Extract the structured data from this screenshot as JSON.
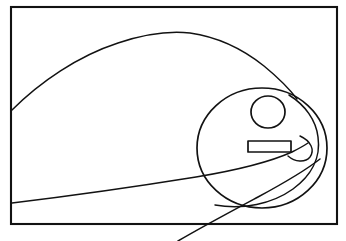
{
  "document": {
    "title": "Line Drawing",
    "width": 346,
    "height": 241,
    "background_color": "#ffffff",
    "ink_color": "#121212",
    "description": "Black-and-white hand-drawn line sketch inside a rectangular frame"
  },
  "frame": {
    "name": "border-rectangle",
    "x": 11,
    "y": 7,
    "width": 326,
    "height": 217,
    "stroke_width": 2.1,
    "color": "#121212"
  },
  "shapes": {
    "top_sweep": {
      "name": "top-sweeping-curve",
      "label": "Large arc from left border rising to apex then descending right",
      "start": [
        12,
        110
      ],
      "apex": [
        187,
        32
      ],
      "end": [
        297,
        99
      ],
      "path": "M 12,110 C 40,82 78,56 118,43 C 148,33 172,31 190,33 C 218,37 244,50 264,66 C 281,80 291,91 297,99"
    },
    "head_circle": {
      "name": "large-head-circle",
      "label": "Big circle forming the head",
      "cx": 262,
      "cy": 148,
      "rx": 65,
      "ry": 60,
      "left_edge_x": 197,
      "right_edge_x": 327,
      "top_y": 88,
      "bottom_y": 208
    },
    "eye_circle": {
      "name": "eye-circle",
      "label": "Small circle forming the eye",
      "cx": 268,
      "cy": 112,
      "rx": 17,
      "ry": 16,
      "left_edge_x": 251,
      "right_edge_x": 285,
      "top_y": 96,
      "bottom_y": 128
    },
    "mouth_rect": {
      "name": "mouth-rectangle",
      "label": "Small horizontal rectangle forming the mouth",
      "x": 248,
      "y": 141,
      "width": 43,
      "height": 11,
      "stroke_width": 1.7
    },
    "lower_sweep": {
      "name": "lower-long-curve",
      "label": "Long shallow curve from left border sloping gently up to the right then bending down past the bottom border",
      "start": [
        12,
        203
      ],
      "end": [
        178,
        241
      ],
      "path": "M 12,203 C 70,196 140,186 196,177 C 238,170 272,161 292,152 C 300,148 305,145 308,143"
    },
    "spiral_hook": {
      "name": "inner-spiral-hook-curve",
      "label": "Spiral curve that wraps from the eye area down and around the head interior",
      "path": "M 289,95 C 305,105 316,120 318,137 C 321,158 311,176 293,189 C 272,204 243,210 215,205"
    },
    "inner_hook": {
      "name": "inner-small-hook-arc",
      "label": "Small hook arc at the right of the mouth",
      "start": [
        300,
        136
      ],
      "end": [
        288,
        156
      ],
      "path": "M 300,136 C 311,141 315,150 310,157 C 305,163 295,162 288,156"
    },
    "tail_curve": {
      "name": "tail-diagonal-curve",
      "label": "Diagonal curve passing from lower left across the bottom border",
      "path": "M 178,241 C 200,228 230,212 258,197 C 284,183 306,170 320,159"
    }
  },
  "annotations": {
    "stroke_style": "hand-drawn black ink, uniform thin weight",
    "fill": "none",
    "shape_count": 7
  }
}
